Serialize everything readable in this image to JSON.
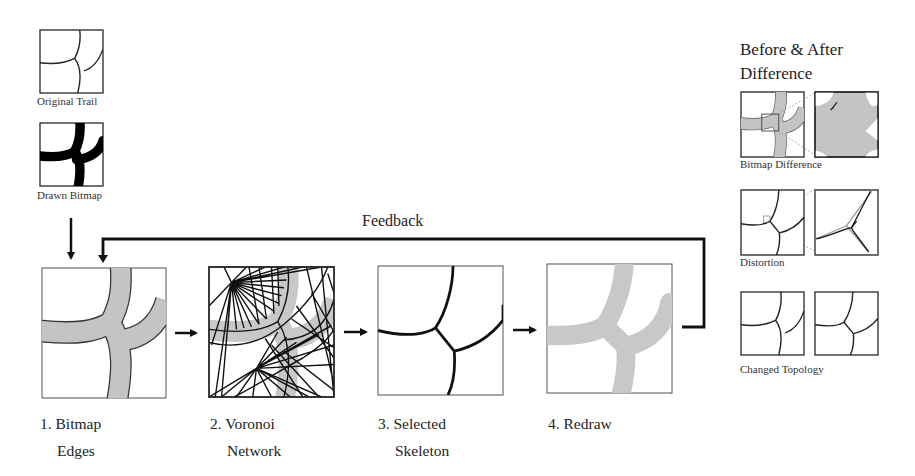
{
  "inputs": {
    "original_trail": {
      "label": "Original Trail"
    },
    "drawn_bitmap": {
      "label": "Drawn Bitmap"
    }
  },
  "feedback": {
    "label": "Feedback"
  },
  "steps": [
    {
      "line1": "1. Bitmap",
      "line2": "Edges"
    },
    {
      "line1": "2. Voronoi",
      "line2": "Network"
    },
    {
      "line1": "3. Selected",
      "line2": "Skeleton"
    },
    {
      "line1": "4. Redraw",
      "line2": ""
    }
  ],
  "comparison": {
    "title_line1": "Before & After",
    "title_line2": "Difference",
    "panels": [
      {
        "label": "Bitmap Difference"
      },
      {
        "label": "Distortion"
      },
      {
        "label": "Changed Topology"
      }
    ]
  },
  "colors": {
    "trail_fill": "#c4c4c4",
    "line": "#111111",
    "frame": "#555555",
    "background": "#ffffff"
  }
}
